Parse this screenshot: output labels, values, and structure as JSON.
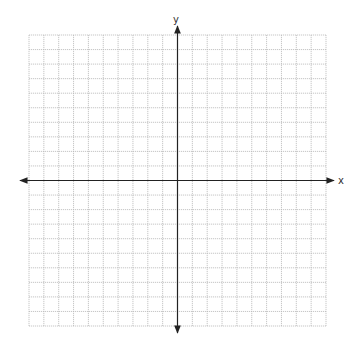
{
  "chart_data": {
    "type": "coordinate-grid",
    "title": "",
    "xlabel": "x",
    "ylabel": "y",
    "xlim": [
      -10,
      10
    ],
    "ylim": [
      -10,
      10
    ],
    "grid": true,
    "grid_step": 1,
    "axes_arrows": true,
    "tick_labels": false
  },
  "colors": {
    "grid": "#b8b8b8",
    "axis": "#222222",
    "background": "#ffffff"
  }
}
